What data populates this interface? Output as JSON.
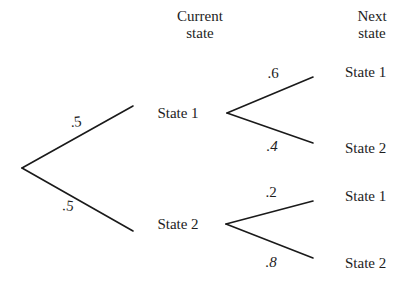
{
  "figure": {
    "type": "probability-tree",
    "background_color": "#ffffff",
    "line_color": "#1a1a1a",
    "text_color": "#1d1d1d"
  },
  "headers": {
    "current": {
      "line1": "Current",
      "line2": "state",
      "x": 200,
      "y": 8
    },
    "next": {
      "line1": "Next",
      "line2": "state",
      "x": 372,
      "y": 8
    }
  },
  "root": {
    "x": 22,
    "y": 168
  },
  "nodes": [
    {
      "id": "current-state-1",
      "label": "State 1",
      "x": 178,
      "y": 113,
      "fan_x": 227,
      "fan_y": 113,
      "edge_end_x": 133,
      "edge_end_y": 106
    },
    {
      "id": "current-state-2",
      "label": "State 2",
      "x": 178,
      "y": 224,
      "fan_x": 226,
      "fan_y": 224,
      "edge_end_x": 133,
      "edge_end_y": 231
    }
  ],
  "leaves": [
    {
      "id": "next-state-1a",
      "label": "State 1",
      "x": 345,
      "y": 72,
      "line_start_x": 313,
      "line_start_y": 77
    },
    {
      "id": "next-state-2a",
      "label": "State 2",
      "x": 345,
      "y": 148,
      "line_start_x": 313,
      "line_start_y": 143
    },
    {
      "id": "next-state-1b",
      "label": "State 1",
      "x": 345,
      "y": 196,
      "line_start_x": 313,
      "line_start_y": 201
    },
    {
      "id": "next-state-2b",
      "label": "State 2",
      "x": 345,
      "y": 263,
      "line_start_x": 313,
      "line_start_y": 258
    }
  ],
  "probabilities": [
    {
      "id": "p-root-state1",
      "value": ".5",
      "x": 76,
      "y": 122,
      "style": "tiltA"
    },
    {
      "id": "p-root-state2",
      "value": ".5",
      "x": 68,
      "y": 206,
      "style": "tiltB"
    },
    {
      "id": "p-s1-to-s1",
      "value": ".6",
      "x": 273,
      "y": 73,
      "style": "plain"
    },
    {
      "id": "p-s1-to-s2",
      "value": ".4",
      "x": 272,
      "y": 146,
      "style": "italic"
    },
    {
      "id": "p-s2-to-s1",
      "value": ".2",
      "x": 271,
      "y": 192,
      "style": "plain"
    },
    {
      "id": "p-s2-to-s2",
      "value": ".8",
      "x": 271,
      "y": 262,
      "style": "italic"
    }
  ],
  "chart_data": {
    "type": "diagram",
    "levels": [
      "Current state",
      "Next state"
    ],
    "branches": [
      {
        "from": "Start",
        "to": "State 1",
        "probability": 0.5,
        "label": ".5",
        "level": 1
      },
      {
        "from": "Start",
        "to": "State 2",
        "probability": 0.5,
        "label": ".5",
        "level": 1
      },
      {
        "from": "State 1",
        "to": "State 1",
        "probability": 0.6,
        "label": ".6",
        "level": 2
      },
      {
        "from": "State 1",
        "to": "State 2",
        "probability": 0.4,
        "label": ".4",
        "level": 2
      },
      {
        "from": "State 2",
        "to": "State 1",
        "probability": 0.2,
        "label": ".2",
        "level": 2
      },
      {
        "from": "State 2",
        "to": "State 2",
        "probability": 0.8,
        "label": ".8",
        "level": 2
      }
    ]
  }
}
